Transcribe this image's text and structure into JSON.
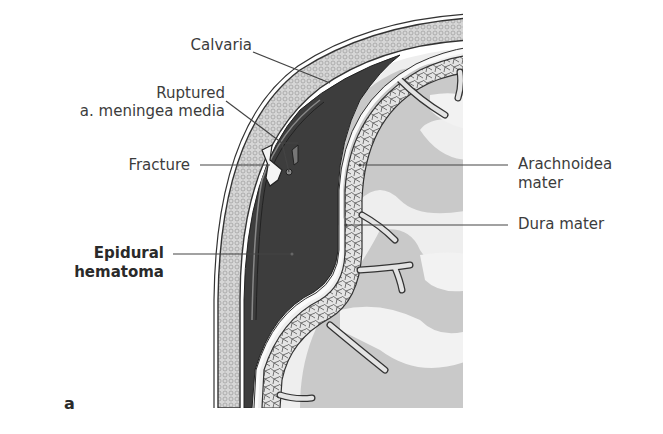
{
  "figure": {
    "panel_letter": "a",
    "labels": {
      "calvaria": "Calvaria",
      "ruptured_line1": "Ruptured",
      "ruptured_line2": "a. meningea media",
      "fracture": "Fracture",
      "epidural_line1": "Epidural",
      "epidural_line2": "hematoma",
      "arachnoidea_line1": "Arachnoidea",
      "arachnoidea_line2": "mater",
      "dura": "Dura mater"
    },
    "colors": {
      "hematoma": "#3d3d3d",
      "bone": "#d9d9d9",
      "cortex_gray": "#c8c8c8",
      "white_matter": "#ececec",
      "arachnoid": "#e0e0e0",
      "line": "#3a3a3a"
    }
  }
}
